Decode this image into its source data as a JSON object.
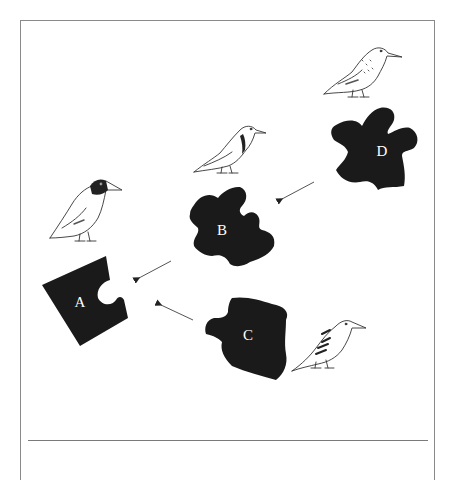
{
  "diagram": {
    "type": "puzzle-piece sequence illustration",
    "pieces": [
      {
        "id": "A",
        "label": "A",
        "color": "#1a1a1a"
      },
      {
        "id": "B",
        "label": "B",
        "color": "#1a1a1a"
      },
      {
        "id": "C",
        "label": "C",
        "color": "#1a1a1a"
      },
      {
        "id": "D",
        "label": "D",
        "color": "#1a1a1a"
      }
    ],
    "arrows": [
      {
        "from": "D",
        "to": "B"
      },
      {
        "from": "B",
        "to": "A"
      },
      {
        "from": "C",
        "to": "A"
      }
    ],
    "birds": [
      {
        "id": "bird-a",
        "near_piece": "A",
        "description": "bird with dark head"
      },
      {
        "id": "bird-b",
        "near_piece": "B",
        "description": "bird with dark collar band"
      },
      {
        "id": "bird-c",
        "near_piece": "C",
        "description": "bird with barred wing markings"
      },
      {
        "id": "bird-d",
        "near_piece": "D",
        "description": "bird with speckled breast"
      }
    ],
    "colors": {
      "piece_fill": "#1a1a1a",
      "label_text": "#ffffff",
      "frame_border": "#8a8a8a",
      "arrow": "#555555",
      "background": "#ffffff"
    }
  }
}
